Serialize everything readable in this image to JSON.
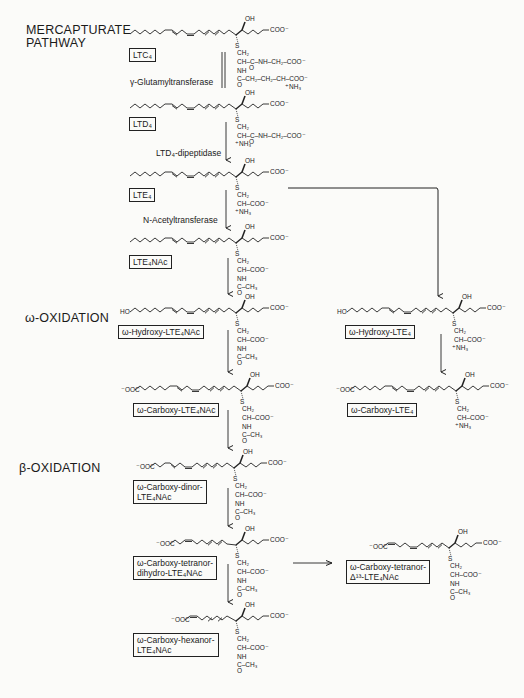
{
  "sections": {
    "mercapturate": "MERCAPTURATE\nPATHWAY",
    "omega_oxidation": "ω-OXIDATION",
    "beta_oxidation": "β-OXIDATION"
  },
  "enzymes": {
    "gamma_gt": "γ-Glutamyltransferase",
    "ltd4_dipeptidase": "LTD₄-dipeptidase",
    "n_acetyltransferase": "N-Acetyltransferase"
  },
  "compounds": {
    "ltc4": "LTC₄",
    "ltd4": "LTD₄",
    "lte4": "LTE₄",
    "lte4nac": "LTE₄NAc",
    "w_hydroxy_lte4nac": "ω-Hydroxy-LTE₄NAc",
    "w_carboxy_lte4nac": "ω-Carboxy-LTE₄NAc",
    "w_carboxy_dinor_1": "ω-Carboxy-dinor-",
    "w_carboxy_dinor_2": "LTE₄NAc",
    "w_carboxy_tetranor_dihydro_1": "ω-Carboxy-tetranor-",
    "w_carboxy_tetranor_dihydro_2": "dihydro-LTE₄NAc",
    "w_carboxy_hexanor_1": "ω-Carboxy-hexanor-",
    "w_carboxy_hexanor_2": "LTE₄NAc",
    "w_hydroxy_lte4": "ω-Hydroxy-LTE₄",
    "w_carboxy_lte4": "ω-Carboxy-LTE₄",
    "w_carboxy_tetranor_d13_1": "ω-Carboxy-tetranor-",
    "w_carboxy_tetranor_d13_2": "Δ¹³-LTE₄NAc"
  },
  "chem_labels": {
    "oh": "OH",
    "coo": "COO⁻",
    "ooc": "⁻OOC",
    "ho": "HO",
    "s": "S",
    "ch2": "CH₂",
    "ch_coo": "CH–COO⁻",
    "nh": "NH",
    "nh3": "⁺NH₃",
    "c_ch3": "C–CH₃",
    "o": "O",
    "ltc4_gly": "CH–C–NH–CH₂–COO⁻",
    "ltc4_glu": "C–CH₂–CH₂–CH–COO⁻",
    "ltd4_gly": "CH–C–NH–CH₂–COO⁻"
  }
}
